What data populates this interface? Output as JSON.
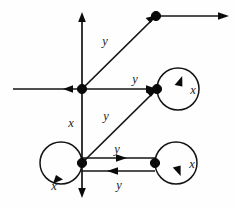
{
  "figure": {
    "type": "directed-graph-on-axes",
    "background_color": "#fefefe",
    "ink_color": "#141414",
    "width": 237,
    "height": 207
  },
  "axes": {
    "vertical": {
      "name": "vertical-axis",
      "x": 82,
      "y_top": 14,
      "y_bottom": 196,
      "arrow_top": "up",
      "arrow_bottom": "down"
    },
    "horizontal": {
      "name": "horizontal-axis",
      "y": 89,
      "x_left": 13,
      "x_right": 82,
      "arrow_at_origin": "left"
    }
  },
  "nodes": [
    {
      "id": "origin",
      "label": "origin-node",
      "x": 82,
      "y": 89,
      "r": 4.6
    },
    {
      "id": "top-right",
      "label": "top-right-node",
      "x": 156,
      "y": 16,
      "r": 4.6
    },
    {
      "id": "middle-right",
      "label": "middle-right-node",
      "x": 157,
      "y": 89,
      "r": 4.6
    },
    {
      "id": "bottom-left",
      "label": "bottom-left-node",
      "x": 82,
      "y": 163,
      "r": 4.6
    },
    {
      "id": "bottom-right",
      "label": "bottom-right-node",
      "x": 155,
      "y": 163,
      "r": 4.6
    }
  ],
  "edges": [
    {
      "id": "origin-to-topright",
      "name": "edge-y-origin-to-topright",
      "label": "y",
      "from": "origin",
      "to": "top-right",
      "label_x": 105,
      "label_y": 42,
      "direction": "up-right"
    },
    {
      "id": "topright-outgoing",
      "name": "edge-topright-outgoing-ray",
      "label": "",
      "from": "top-right",
      "to": "right-edge",
      "label_x": 0,
      "label_y": 0,
      "direction": "right"
    },
    {
      "id": "origin-to-middleright",
      "name": "edge-y-origin-to-middleright",
      "label": "y",
      "from": "origin",
      "to": "middle-right",
      "label_x": 135,
      "label_y": 80,
      "direction": "right"
    },
    {
      "id": "bottomleft-to-middleright",
      "name": "edge-y-bottomleft-to-middleright",
      "label": "y",
      "from": "bottom-left",
      "to": "middle-right",
      "label_x": 106,
      "label_y": 117,
      "direction": "up-right"
    },
    {
      "id": "bottomleft-to-bottomright",
      "name": "edge-y-bottomleft-to-bottomright",
      "label": "y",
      "from": "bottom-left",
      "to": "bottom-right",
      "label_x": 117,
      "label_y": 150,
      "direction": "right"
    },
    {
      "id": "bottomright-to-bottomleft",
      "name": "edge-y-bottomright-to-bottomleft",
      "label": "y",
      "from": "bottom-right",
      "to": "bottom-left",
      "label_x": 119,
      "label_y": 186,
      "direction": "left"
    },
    {
      "id": "origin-to-bottomleft",
      "name": "edge-x-origin-to-bottomleft",
      "label": "x",
      "from": "origin",
      "to": "bottom-left",
      "label_x": 71,
      "label_y": 124,
      "direction": "down"
    }
  ],
  "self_loops": [
    {
      "id": "loop-middle-right",
      "name": "self-loop-x-middleright",
      "label": "x",
      "node": "middle-right",
      "side": "right",
      "label_x": 191,
      "label_y": 91,
      "arrow": "up"
    },
    {
      "id": "loop-bottom-left",
      "name": "self-loop-x-bottomleft",
      "label": "x",
      "node": "bottom-left",
      "side": "left",
      "label_x": 54,
      "label_y": 186,
      "arrow": "down-left"
    },
    {
      "id": "loop-bottom-right",
      "name": "self-loop-x-bottomright",
      "label": "x",
      "node": "bottom-right",
      "side": "right",
      "label_x": 190,
      "label_y": 165,
      "arrow": "down"
    }
  ],
  "labels": {
    "x": "x",
    "y": "y",
    "y_up_diagonal": "y",
    "y_middle_horizontal": "y",
    "y_lower_diagonal": "y",
    "y_bottom_top_edge": "y",
    "y_bottom_bottom_edge": "y",
    "x_vertical": "x",
    "x_loop_middle_right": "x",
    "x_loop_bottom_left": "x",
    "x_loop_bottom_right": "x"
  }
}
